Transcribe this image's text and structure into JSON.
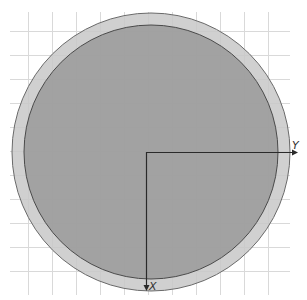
{
  "viewport": {
    "width": 307,
    "height": 300
  },
  "grid": {
    "color": "#d9d9d9",
    "spacing": 24,
    "x_start": 28,
    "x_end": 290,
    "y_start": 31,
    "y_end": 290,
    "left": 10,
    "right": 290,
    "top": 12,
    "bottom": 295
  },
  "shapes": {
    "outer_circle": {
      "cx": 151,
      "cy": 152,
      "r": 139,
      "fill": "#c8c8c8",
      "stroke": "#6a6a6a"
    },
    "inner_circle": {
      "cx": 151,
      "cy": 152,
      "r": 127,
      "fill": "#9a9a9a",
      "stroke": "#4a4a4a"
    }
  },
  "axes": {
    "origin": {
      "x": 146,
      "y": 152
    },
    "color": "#2a2a2a",
    "y_axis": {
      "label": "Y",
      "end_x": 298
    },
    "x_axis": {
      "label": "X",
      "end_y": 291
    }
  }
}
